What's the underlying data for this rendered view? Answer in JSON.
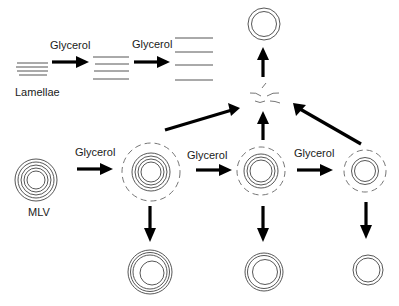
{
  "diagram": {
    "labels": {
      "lamellae": "Lamellae",
      "mlv": "MLV",
      "glycerol_1": "Glycerol",
      "glycerol_2": "Glycerol",
      "glycerol_3": "Glycerol",
      "glycerol_4": "Glycerol",
      "glycerol_5": "Glycerol"
    },
    "nodes": [
      {
        "id": "lamellae-1",
        "type": "lamellae",
        "layers": 4,
        "spacing": "tight"
      },
      {
        "id": "lamellae-2",
        "type": "lamellae",
        "layers": 4,
        "spacing": "medium"
      },
      {
        "id": "lamellae-3",
        "type": "lamellae",
        "layers": 4,
        "spacing": "wide"
      },
      {
        "id": "mlv",
        "type": "vesicle",
        "solid_rings": 5,
        "dashed_ring": false
      },
      {
        "id": "vesicle-1",
        "type": "vesicle",
        "solid_rings": 4,
        "dashed_ring": true
      },
      {
        "id": "vesicle-2",
        "type": "vesicle",
        "solid_rings": 3,
        "dashed_ring": true
      },
      {
        "id": "vesicle-3",
        "type": "vesicle",
        "solid_rings": 2,
        "dashed_ring": true
      },
      {
        "id": "fusion-fragments",
        "type": "fragments"
      },
      {
        "id": "top-vesicle",
        "type": "vesicle",
        "solid_rings": 2,
        "dashed_ring": false
      },
      {
        "id": "bottom-vesicle-1",
        "type": "vesicle",
        "solid_rings": 4,
        "dashed_ring": false
      },
      {
        "id": "bottom-vesicle-2",
        "type": "vesicle",
        "solid_rings": 3,
        "dashed_ring": false
      },
      {
        "id": "bottom-vesicle-3",
        "type": "vesicle",
        "solid_rings": 2,
        "dashed_ring": false
      }
    ],
    "edges": [
      {
        "from": "lamellae-1",
        "to": "lamellae-2",
        "label": "Glycerol"
      },
      {
        "from": "lamellae-2",
        "to": "lamellae-3",
        "label": "Glycerol"
      },
      {
        "from": "mlv",
        "to": "vesicle-1",
        "label": "Glycerol"
      },
      {
        "from": "vesicle-1",
        "to": "vesicle-2",
        "label": "Glycerol"
      },
      {
        "from": "vesicle-2",
        "to": "vesicle-3",
        "label": "Glycerol"
      },
      {
        "from": "vesicle-1",
        "to": "fusion-fragments",
        "label": ""
      },
      {
        "from": "vesicle-2",
        "to": "fusion-fragments",
        "label": ""
      },
      {
        "from": "vesicle-3",
        "to": "fusion-fragments",
        "label": ""
      },
      {
        "from": "fusion-fragments",
        "to": "top-vesicle",
        "label": ""
      },
      {
        "from": "vesicle-1",
        "to": "bottom-vesicle-1",
        "label": ""
      },
      {
        "from": "vesicle-2",
        "to": "bottom-vesicle-2",
        "label": ""
      },
      {
        "from": "vesicle-3",
        "to": "bottom-vesicle-3",
        "label": ""
      }
    ]
  }
}
